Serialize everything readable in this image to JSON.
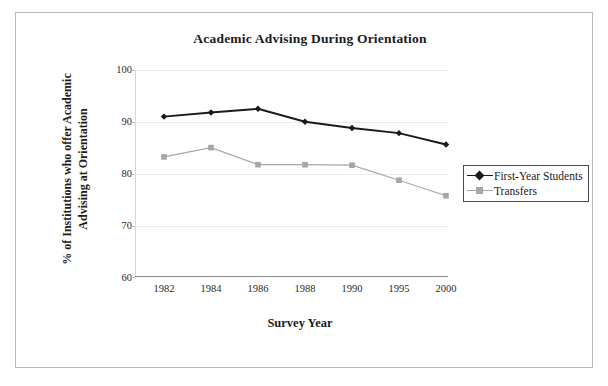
{
  "chart_data": {
    "type": "line",
    "title": "Academic Advising During Orientation",
    "xlabel": "Survey Year",
    "ylabel": "% of Institutions who offer Academic Advising at Orientation",
    "ylabel_line1": "% of Institutions who offer Academic",
    "ylabel_line2": "Advising at Orientation",
    "categories": [
      "1982",
      "1984",
      "1986",
      "1988",
      "1990",
      "1995",
      "2000"
    ],
    "ylim": [
      60,
      100
    ],
    "yticks": [
      "100",
      "90",
      "80",
      "70",
      "60"
    ],
    "grid": true,
    "legend_position": "right",
    "series": [
      {
        "name": "First-Year Students",
        "color": "#1a1a1a",
        "marker": "diamond",
        "values": [
          91.0,
          91.8,
          92.5,
          90.0,
          88.8,
          87.8,
          85.6
        ]
      },
      {
        "name": "Transfers",
        "color": "#a6a6a6",
        "marker": "square",
        "values": [
          83.2,
          85.0,
          81.7,
          81.7,
          81.6,
          78.7,
          75.7
        ]
      }
    ]
  },
  "chart": {
    "title": "Academic Advising During Orientation",
    "x_axis_title": "Survey Year",
    "y_axis_title_line1": "% of Institutions who offer Academic",
    "y_axis_title_line2": "Advising at Orientation",
    "y_ticks": [
      "100",
      "90",
      "80",
      "70",
      "60"
    ],
    "x_ticks": [
      "1982",
      "1984",
      "1986",
      "1988",
      "1990",
      "1995",
      "2000"
    ],
    "legend": [
      {
        "label": "First-Year Students",
        "color": "#1a1a1a",
        "marker": "diamond-marker"
      },
      {
        "label": "Transfers",
        "color": "#a6a6a6",
        "marker": "square-marker"
      }
    ]
  }
}
